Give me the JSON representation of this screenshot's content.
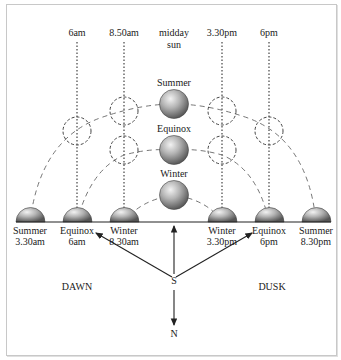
{
  "diagram": {
    "time_labels": [
      {
        "text": "6am",
        "x": 77
      },
      {
        "text": "8.50am",
        "x": 124
      },
      {
        "text": "midday",
        "x": 174,
        "line2": "sun"
      },
      {
        "text": "3.30pm",
        "x": 222
      },
      {
        "text": "6pm",
        "x": 269
      }
    ],
    "midday_suns": [
      {
        "label": "Summer",
        "y": 104
      },
      {
        "label": "Equinox",
        "y": 150
      },
      {
        "label": "Winter",
        "y": 195
      }
    ],
    "horizon_suns": [
      {
        "line1": "Summer",
        "line2": "3.30am",
        "x": 30
      },
      {
        "line1": "Equinox",
        "line2": "6am",
        "x": 77
      },
      {
        "line1": "Winter",
        "line2": "8.30am",
        "x": 124
      },
      {
        "line1": "Winter",
        "line2": "3.30pm",
        "x": 222
      },
      {
        "line1": "Equinox",
        "line2": "6pm",
        "x": 269
      },
      {
        "line1": "Summer",
        "line2": "8.30pm",
        "x": 316
      }
    ],
    "compass": {
      "south": "S",
      "north": "N"
    },
    "sides": {
      "left": "DAWN",
      "right": "DUSK"
    },
    "colors": {
      "line": "#333333",
      "sun_light": "#e6e6e6",
      "sun_dark": "#6e6e6e",
      "frame": "#c8c8c8"
    }
  }
}
